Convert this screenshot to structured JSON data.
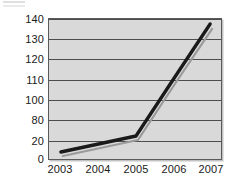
{
  "chart_data": {
    "type": "line",
    "title": "",
    "subtitle": "",
    "xlabel": "",
    "ylabel": "",
    "x": [
      2003,
      2004,
      2005,
      2006,
      2007
    ],
    "categories": [
      "2003",
      "2004",
      "2005",
      "2006",
      "2007"
    ],
    "xticklabels": [
      "2003",
      "2004",
      "2005",
      "2006",
      "2007"
    ],
    "yticklabels": [
      "140",
      "130",
      "120",
      "110",
      "100",
      "80",
      "20",
      "0"
    ],
    "ytickvalues": [
      140,
      130,
      120,
      110,
      100,
      80,
      20,
      0
    ],
    "ylim": [
      0,
      140
    ],
    "xlim": [
      2003,
      2007
    ],
    "grid": "horizontal",
    "legend": "none",
    "series": [
      {
        "name": "series-1",
        "color": "#1a1a1a",
        "style": "solid-thick",
        "values": [
          7,
          15,
          23,
          80,
          135
        ]
      },
      {
        "name": "series-2",
        "color": "#9a9a9a",
        "style": "solid-thin",
        "values": [
          5,
          13,
          21,
          78,
          132
        ]
      }
    ],
    "plot_background": "#d9d9d9",
    "axis_color": "#5a5a5a",
    "gridline_color": "#4d4d4d",
    "annotations": []
  },
  "yaxis": {
    "ticks": [
      {
        "label": "140",
        "top": 14
      },
      {
        "label": "130",
        "top": 34
      },
      {
        "label": "120",
        "top": 54
      },
      {
        "label": "110",
        "top": 75
      },
      {
        "label": "100",
        "top": 95
      },
      {
        "label": "80",
        "top": 115
      },
      {
        "label": "20",
        "top": 136
      },
      {
        "label": "0",
        "top": 154
      }
    ]
  },
  "xaxis": {
    "ticks": [
      {
        "label": "2003",
        "left": 12
      },
      {
        "label": "2004",
        "left": 50
      },
      {
        "label": "2005",
        "left": 88
      },
      {
        "label": "2006",
        "left": 126
      },
      {
        "label": "2007",
        "left": 163
      }
    ]
  },
  "gridlines": {
    "tops": [
      0,
      20.3,
      40.6,
      60.9,
      81.2,
      101.5,
      121.8,
      140
    ]
  }
}
